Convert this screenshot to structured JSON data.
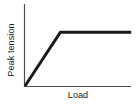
{
  "figure": {
    "background_color": "#ffffff",
    "axis_color": "#4d4d4d",
    "line_color": "#1a1a1a",
    "text_color": "#1a1a1a"
  },
  "axes": {
    "ylabel": "Peak tension",
    "xlabel": "Load"
  },
  "chart_data": {
    "type": "line",
    "title": "",
    "subtitle": "",
    "xlabel": "Load",
    "ylabel": "Peak tension",
    "xlim": [
      0,
      1
    ],
    "ylim": [
      0,
      1
    ],
    "grid": false,
    "legend": null,
    "xticks": [],
    "yticks": [],
    "xticklabels": [],
    "yticklabels": [],
    "annotations": [],
    "series": [
      {
        "name": "peak tension vs load",
        "linewidth": 3,
        "color": "#1a1a1a",
        "x": [
          0,
          0.3,
          0.9
        ],
        "y": [
          0,
          0.66,
          0.66
        ]
      }
    ]
  }
}
